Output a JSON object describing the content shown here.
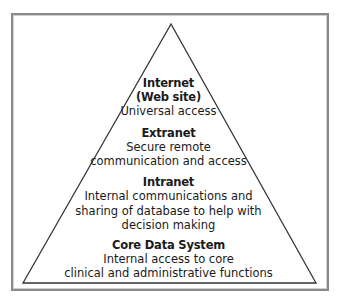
{
  "diagram": {
    "type": "pyramid",
    "levels": [
      {
        "title": "Internet",
        "subtitle": "(Web site)",
        "lines": [
          "Universal access"
        ]
      },
      {
        "title": "Extranet",
        "lines": [
          "Secure remote",
          "communication and access"
        ]
      },
      {
        "title": "Intranet",
        "lines": [
          "Internal communications and",
          "sharing of database to help with",
          "decision making"
        ]
      },
      {
        "title": "Core Data System",
        "lines": [
          "Internal access to core",
          "clinical and administrative functions"
        ]
      }
    ],
    "colors": {
      "line": "#333333",
      "frame": "#8a8a8a",
      "text": "#1a1a1a",
      "background": "#ffffff"
    }
  }
}
